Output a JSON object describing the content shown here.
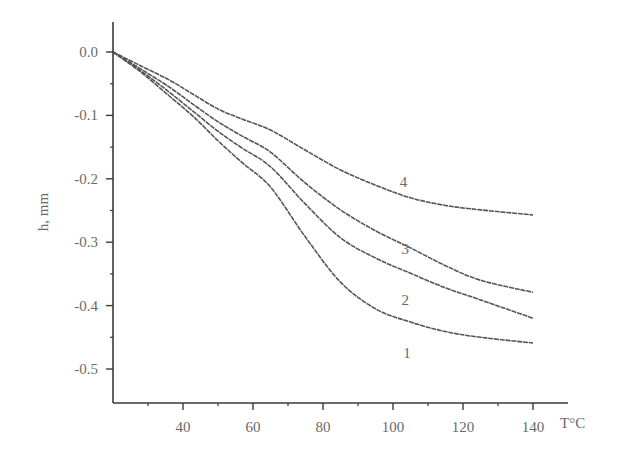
{
  "chart_data": {
    "type": "line",
    "title": "",
    "xlabel": "T°C",
    "ylabel": "h, mm",
    "xlim": [
      20,
      150
    ],
    "ylim": [
      -0.553,
      0.02
    ],
    "x_ticks": [
      40,
      60,
      80,
      100,
      120,
      140
    ],
    "x_tick_labels": [
      "40",
      "60",
      "80",
      "100",
      "120",
      "140"
    ],
    "x_minor_ticks": [
      30,
      50,
      70,
      90,
      110,
      130
    ],
    "y_ticks": [
      0.0,
      -0.1,
      -0.2,
      -0.3,
      -0.4,
      -0.5
    ],
    "y_tick_labels": [
      "0.0",
      "-0.1",
      "-0.2",
      "-0.3",
      "-0.4",
      "-0.5"
    ],
    "y_minor_ticks": [
      -0.05,
      -0.15,
      -0.25,
      -0.35,
      -0.45
    ],
    "grid": false,
    "legend": "inline curve labels near right end",
    "series": [
      {
        "name": "1",
        "label_pos": [
          104,
          -0.474
        ],
        "x": [
          20,
          28,
          36,
          43,
          50,
          57,
          65,
          75,
          85,
          95,
          105,
          115,
          125,
          140
        ],
        "y": [
          0,
          -0.032,
          -0.069,
          -0.102,
          -0.14,
          -0.175,
          -0.213,
          -0.292,
          -0.363,
          -0.405,
          -0.426,
          -0.441,
          -0.45,
          -0.459
        ]
      },
      {
        "name": "2",
        "label_pos": [
          103.5,
          -0.391
        ],
        "x": [
          20,
          28,
          36,
          43,
          50,
          57,
          65,
          75,
          85,
          95,
          105,
          115,
          125,
          140
        ],
        "y": [
          0,
          -0.03,
          -0.063,
          -0.094,
          -0.125,
          -0.152,
          -0.181,
          -0.24,
          -0.293,
          -0.325,
          -0.349,
          -0.372,
          -0.391,
          -0.42
        ]
      },
      {
        "name": "3",
        "label_pos": [
          103.5,
          -0.311
        ],
        "x": [
          20,
          28,
          36,
          43,
          50,
          57,
          65,
          75,
          85,
          95,
          105,
          115,
          125,
          140
        ],
        "y": [
          0,
          -0.027,
          -0.055,
          -0.083,
          -0.11,
          -0.133,
          -0.158,
          -0.207,
          -0.249,
          -0.282,
          -0.309,
          -0.337,
          -0.36,
          -0.379
        ]
      },
      {
        "name": "4",
        "label_pos": [
          103,
          -0.205
        ],
        "x": [
          20,
          28,
          36,
          43,
          50,
          57,
          65,
          75,
          85,
          95,
          105,
          115,
          125,
          140
        ],
        "y": [
          0,
          -0.022,
          -0.044,
          -0.067,
          -0.09,
          -0.106,
          -0.123,
          -0.155,
          -0.186,
          -0.21,
          -0.23,
          -0.242,
          -0.249,
          -0.257
        ]
      }
    ]
  },
  "colors": {
    "axis": "#3a3a3a",
    "curve": "#555555",
    "text": "#6a6a6a",
    "background": "#ffffff"
  }
}
